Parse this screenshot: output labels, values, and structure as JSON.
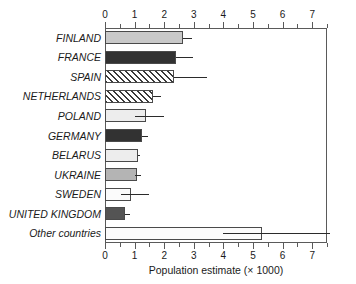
{
  "chart_data": {
    "type": "bar",
    "orientation": "horizontal",
    "title": "",
    "xlabel": "Population estimate (× 1000)",
    "ylabel": "",
    "xlim": [
      0,
      7.5
    ],
    "xticks": [
      0,
      1,
      2,
      3,
      4,
      5,
      6,
      7
    ],
    "xtick_labels": [
      "0",
      "1",
      "2",
      "3",
      "4",
      "5",
      "6",
      "7"
    ],
    "axis_top": true,
    "axis_bottom": true,
    "grid": false,
    "legend": "none",
    "categories": [
      "FINLAND",
      "FRANCE",
      "SPAIN",
      "NETHERLANDS",
      "POLAND",
      "GERMANY",
      "BELARUS",
      "UKRAINE",
      "SWEDEN",
      "UNITED KINGDOM",
      "Other countries"
    ],
    "values": [
      2.64,
      2.41,
      2.34,
      1.61,
      1.39,
      1.24,
      1.11,
      1.09,
      0.87,
      0.67,
      5.3
    ],
    "error_low": [
      2.64,
      2.41,
      2.34,
      1.61,
      1.0,
      1.24,
      1.11,
      1.0,
      0.55,
      0.67,
      4.0
    ],
    "error_high": [
      2.94,
      2.99,
      3.45,
      1.88,
      1.99,
      1.45,
      1.17,
      1.2,
      1.48,
      0.86,
      7.6
    ],
    "fills": [
      "light-gray",
      "darkest",
      "diagonal-hatch",
      "diagonal-hatch",
      "very-light",
      "darkest",
      "very-light",
      "medium-gray",
      "white",
      "dark-gray",
      "white"
    ],
    "colors": {
      "light-gray": "#c9c9c9",
      "darkest": "#323232",
      "very-light": "#ededed",
      "medium-gray": "#b4b4b4",
      "white": "#fbfbfb",
      "dark-gray": "#545454",
      "hatch-line": "#3a3a3a",
      "axis": "#5a5a5a",
      "error": "#2b2b2b",
      "text": "#1a1a1a",
      "background": "#ffffff"
    }
  }
}
